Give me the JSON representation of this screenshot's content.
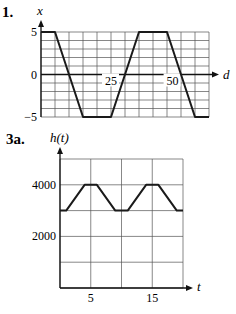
{
  "chart_data": [
    {
      "id": "problem-1",
      "type": "line",
      "problem_label": "1.",
      "xlabel": "d",
      "ylabel": "x",
      "xlim": [
        0,
        60
      ],
      "ylim": [
        -5,
        5
      ],
      "grid": true,
      "x_grid_step": 5,
      "y_grid_step": 1,
      "y_tick_labels": [
        {
          "value": 5,
          "label": "5"
        },
        {
          "value": 0,
          "label": "0"
        },
        {
          "value": -5,
          "label": "−5"
        }
      ],
      "x_tick_labels": [
        {
          "value": 25,
          "label": "25"
        },
        {
          "value": 47,
          "label": "50"
        }
      ],
      "series": [
        {
          "name": "x(d)",
          "x": [
            0,
            5,
            15,
            25,
            35,
            45,
            55,
            60
          ],
          "y": [
            5,
            5,
            -5,
            -5,
            5,
            5,
            -5,
            -5
          ]
        }
      ]
    },
    {
      "id": "problem-3a",
      "type": "line",
      "problem_label": "3a.",
      "xlabel": "t",
      "ylabel": "h(t)",
      "xlim": [
        0,
        20
      ],
      "ylim": [
        0,
        5000
      ],
      "grid": true,
      "x_grid_step": 5,
      "y_grid_step": 1000,
      "y_tick_labels": [
        {
          "value": 4000,
          "label": "4000"
        },
        {
          "value": 2000,
          "label": "2000"
        }
      ],
      "x_tick_labels": [
        {
          "value": 5,
          "label": "5"
        },
        {
          "value": 15,
          "label": "15"
        }
      ],
      "series": [
        {
          "name": "h(t)",
          "x": [
            0,
            1,
            4,
            6,
            9,
            11,
            14,
            16,
            19,
            20
          ],
          "y": [
            3000,
            3000,
            4000,
            4000,
            3000,
            3000,
            4000,
            4000,
            3000,
            3000
          ]
        }
      ]
    }
  ]
}
